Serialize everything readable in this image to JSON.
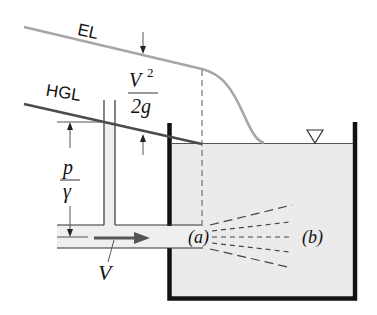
{
  "labels": {
    "energy_line": "EL",
    "hydraulic_grade_line": "HGL",
    "velocity_head_num": "V",
    "velocity_head_exp": "2",
    "velocity_head_den": "2g",
    "pressure_head_num": "p",
    "pressure_head_den": "γ",
    "velocity": "V",
    "point_a": "(a)",
    "point_b": "(b)"
  },
  "colors": {
    "energy_line": "#a6a6a6",
    "hgl": "#4a4a4a",
    "tank_wall": "#111111",
    "tank_fluid": "#ebebeb",
    "pipe_fluid": "#efefef",
    "arrow": "#555555",
    "outline": "#333333"
  }
}
